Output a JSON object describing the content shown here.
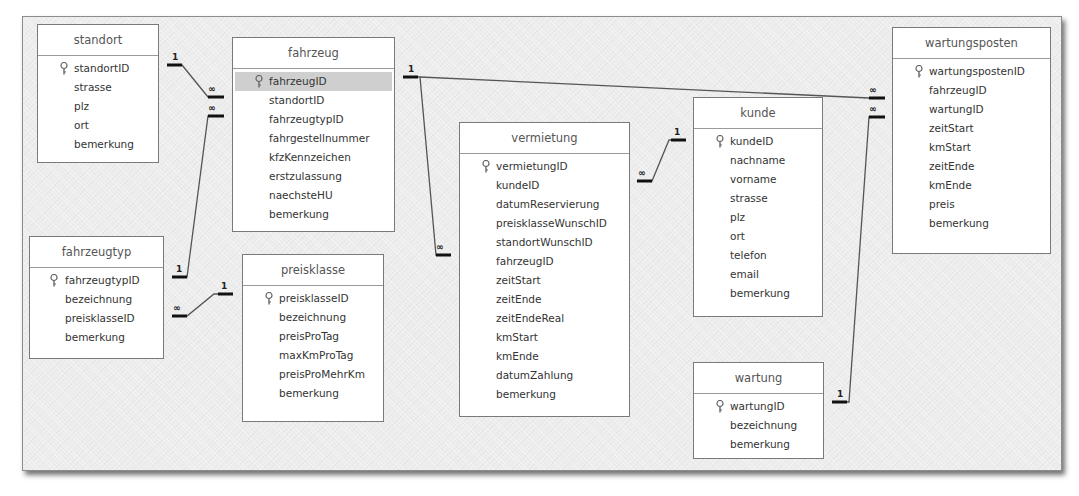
{
  "diagram": {
    "type": "relationship-diagram",
    "tables": [
      {
        "name": "standort",
        "fields": [
          "standortID",
          "strasse",
          "plz",
          "ort",
          "bemerkung"
        ],
        "primary_key": "standortID"
      },
      {
        "name": "fahrzeug",
        "fields": [
          "fahrzeugID",
          "standortID",
          "fahrzeugtypID",
          "fahrgestellnummer",
          "kfzKennzeichen",
          "erstzulassung",
          "naechsteHU",
          "bemerkung"
        ],
        "primary_key": "fahrzeugID",
        "selected_field": "fahrzeugID"
      },
      {
        "name": "fahrzeugtyp",
        "fields": [
          "fahrzeugtypID",
          "bezeichnung",
          "preisklasseID",
          "bemerkung"
        ],
        "primary_key": "fahrzeugtypID"
      },
      {
        "name": "preisklasse",
        "fields": [
          "preisklasseID",
          "bezeichnung",
          "preisProTag",
          "maxKmProTag",
          "preisProMehrKm",
          "bemerkung"
        ],
        "primary_key": "preisklasseID"
      },
      {
        "name": "vermietung",
        "fields": [
          "vermietungID",
          "kundeID",
          "datumReservierung",
          "preisklasseWunschID",
          "standortWunschID",
          "fahrzeugID",
          "zeitStart",
          "zeitEnde",
          "zeitEndeReal",
          "kmStart",
          "kmEnde",
          "datumZahlung",
          "bemerkung"
        ],
        "primary_key": "vermietungID"
      },
      {
        "name": "kunde",
        "fields": [
          "kundeID",
          "nachname",
          "vorname",
          "strasse",
          "plz",
          "ort",
          "telefon",
          "email",
          "bemerkung"
        ],
        "primary_key": "kundeID"
      },
      {
        "name": "wartungsposten",
        "fields": [
          "wartungspostenID",
          "fahrzeugID",
          "wartungID",
          "zeitStart",
          "kmStart",
          "zeitEnde",
          "kmEnde",
          "preis",
          "bemerkung"
        ],
        "primary_key": "wartungspostenID"
      },
      {
        "name": "wartung",
        "fields": [
          "wartungID",
          "bezeichnung",
          "bemerkung"
        ],
        "primary_key": "wartungID"
      }
    ],
    "relationships": [
      {
        "from": "standort.standortID",
        "from_card": "1",
        "to": "fahrzeug.standortID",
        "to_card": "∞"
      },
      {
        "from": "fahrzeugtyp.fahrzeugtypID",
        "from_card": "1",
        "to": "fahrzeug.fahrzeugtypID",
        "to_card": "∞"
      },
      {
        "from": "preisklasse.preisklasseID",
        "from_card": "1",
        "to": "fahrzeugtyp.preisklasseID",
        "to_card": "∞"
      },
      {
        "from": "fahrzeug.fahrzeugID",
        "from_card": "1",
        "to": "vermietung.fahrzeugID",
        "to_card": "∞"
      },
      {
        "from": "fahrzeug.fahrzeugID",
        "from_card": "1",
        "to": "wartungsposten.fahrzeugID",
        "to_card": "∞"
      },
      {
        "from": "kunde.kundeID",
        "from_card": "1",
        "to": "vermietung.kundeID",
        "to_card": "∞"
      },
      {
        "from": "wartung.wartungID",
        "from_card": "1",
        "to": "wartungsposten.wartungID",
        "to_card": "∞"
      }
    ],
    "labels": {
      "one": "1",
      "many": "∞"
    }
  }
}
